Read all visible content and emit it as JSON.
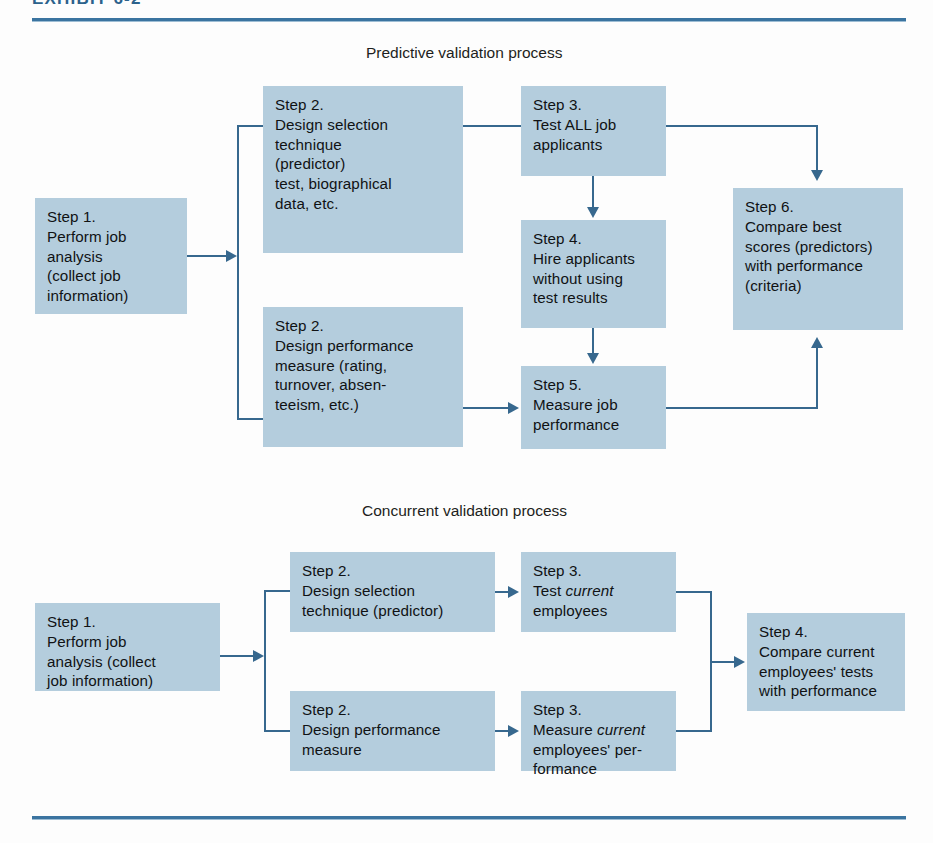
{
  "exhibit": {
    "title": "EXHIBIT 6-2",
    "rule_color": "#3b74a0",
    "box_color": "#b4cddd",
    "line_color": "#37688e"
  },
  "sections": [
    {
      "id": "predictive",
      "caption": "Predictive validation process"
    },
    {
      "id": "concurrent",
      "caption": "Concurrent validation process"
    }
  ],
  "predictive": {
    "caption": "Predictive validation process",
    "boxes": {
      "step1": "Step 1.\nPerform job\nanalysis\n(collect job\ninformation)",
      "step2_selection": "Step 2.\nDesign selection\ntechnique\n(predictor)\ntest, biographical\ndata, etc.",
      "step2_performance": "Step 2.\nDesign performance\nmeasure (rating,\nturnover, absen-\nteeism, etc.)",
      "step3": "Step 3.\nTest ALL job\napplicants",
      "step4": "Step 4.\nHire applicants\nwithout using\ntest results",
      "step5": "Step 5.\nMeasure job\nperformance",
      "step6": "Step 6.\nCompare best\nscores (predictors)\nwith performance\n(criteria)"
    }
  },
  "concurrent": {
    "caption": "Concurrent validation process",
    "boxes": {
      "step1": "Step 1.\nPerform job\nanalysis (collect\njob information)",
      "step2_selection": "Step 2.\nDesign selection\ntechnique (predictor)",
      "step2_performance": "Step 2.\nDesign performance\nmeasure",
      "step3_test_prefix": "Step 3.\nTest ",
      "step3_test_em": "current",
      "step3_test_suffix": "\nemployees",
      "step3_measure_prefix": "Step 3.\nMeasure ",
      "step3_measure_em": "current",
      "step3_measure_suffix": "\nemployees' per-\nformance",
      "step4": "Step 4.\nCompare current\nemployees' tests\nwith performance"
    }
  }
}
